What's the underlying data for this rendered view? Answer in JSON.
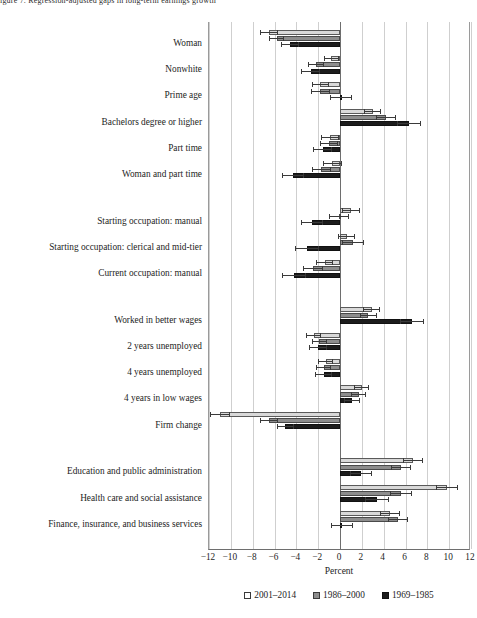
{
  "figure_note": "igure 7. Regression-adjusted gaps in long-term earnings growth",
  "chart_data": {
    "type": "bar",
    "orientation": "horizontal",
    "title": "",
    "xlabel": "Percent",
    "ylabel": "",
    "xlim": [
      -12,
      12
    ],
    "xticks": [
      "−12",
      "−10",
      "−8",
      "−6",
      "−4",
      "−2",
      "0",
      "2",
      "4",
      "6",
      "8",
      "10",
      "12"
    ],
    "xtick_values": [
      -12,
      -10,
      -8,
      -6,
      -4,
      -2,
      0,
      2,
      4,
      6,
      8,
      10,
      12
    ],
    "grid": true,
    "legend_position": "bottom",
    "legend": [
      "2001–2014",
      "1986–2000",
      "1969–1985"
    ],
    "series": [
      {
        "name": "2001–2014",
        "color": "#d9d9d9"
      },
      {
        "name": "1986–2000",
        "color": "#8d8d8d"
      },
      {
        "name": "1969–1985",
        "color": "#1c1c1c"
      }
    ],
    "groups": [
      {
        "rows": [
          {
            "category": "Woman",
            "values": [
              -6.5,
              -5.8,
              -4.6
            ],
            "err_low": [
              -7.3,
              -6.5,
              -5.4
            ],
            "err_high": [
              -5.7,
              -5.1,
              -3.8
            ]
          },
          {
            "category": "Nonwhite",
            "values": [
              -0.8,
              -2.2,
              -2.7
            ],
            "err_low": [
              -1.5,
              -2.9,
              -3.6
            ],
            "err_high": [
              -0.1,
              -1.5,
              -1.8
            ]
          },
          {
            "category": "Prime age",
            "values": [
              -1.8,
              -1.8,
              0.1
            ],
            "err_low": [
              -2.6,
              -2.7,
              -0.9
            ],
            "err_high": [
              -1.0,
              -0.9,
              1.1
            ]
          },
          {
            "category": "Bachelors degree or higher",
            "values": [
              3.0,
              4.2,
              6.3
            ],
            "err_low": [
              2.2,
              3.3,
              5.2
            ],
            "err_high": [
              3.8,
              5.1,
              7.4
            ]
          },
          {
            "category": "Part time",
            "values": [
              -0.9,
              -1.0,
              -1.6
            ],
            "err_low": [
              -1.7,
              -1.8,
              -2.5
            ],
            "err_high": [
              -0.1,
              -0.2,
              -0.7
            ]
          },
          {
            "category": "Woman and part time",
            "values": [
              -0.7,
              -1.7,
              -4.3
            ],
            "err_low": [
              -1.6,
              -2.6,
              -5.3
            ],
            "err_high": [
              0.2,
              -0.8,
              -3.3
            ]
          }
        ]
      },
      {
        "rows": [
          {
            "category": "Starting occupation: manual",
            "values": [
              1.0,
              -0.1,
              -2.6
            ],
            "err_low": [
              0.2,
              -1.0,
              -3.6
            ],
            "err_high": [
              1.8,
              0.8,
              -1.6
            ]
          },
          {
            "category": "Starting occupation: clerical and mid-tier",
            "values": [
              0.6,
              1.2,
              -3.0
            ],
            "err_low": [
              -0.2,
              0.2,
              -4.1
            ],
            "err_high": [
              1.4,
              2.2,
              -1.9
            ]
          },
          {
            "category": "Current occupation: manual",
            "values": [
              -1.4,
              -2.5,
              -4.2
            ],
            "err_low": [
              -2.2,
              -3.4,
              -5.3
            ],
            "err_high": [
              -0.6,
              -1.6,
              -3.1
            ]
          }
        ]
      },
      {
        "rows": [
          {
            "category": "Worked in better wages",
            "values": [
              2.9,
              2.6,
              6.6
            ],
            "err_low": [
              2.1,
              1.8,
              5.5
            ],
            "err_high": [
              3.7,
              3.4,
              7.7
            ]
          },
          {
            "category": "2 years unemployed",
            "values": [
              -2.4,
              -1.9,
              -2.0
            ],
            "err_low": [
              -3.1,
              -2.6,
              -2.8
            ],
            "err_high": [
              -1.7,
              -1.2,
              -1.2
            ]
          },
          {
            "category": "4 years unemployed",
            "values": [
              -1.3,
              -1.5,
              -1.5
            ],
            "err_low": [
              -2.0,
              -2.2,
              -2.3
            ],
            "err_high": [
              -0.6,
              -0.8,
              -0.7
            ]
          },
          {
            "category": "4 years in low wages",
            "values": [
              2.0,
              1.7,
              1.1
            ],
            "err_low": [
              1.3,
              1.0,
              0.4
            ],
            "err_high": [
              2.7,
              2.4,
              1.8
            ]
          },
          {
            "category": "Firm change",
            "values": [
              -11.0,
              -6.5,
              -5.0
            ],
            "err_low": [
              -11.9,
              -7.3,
              -5.8
            ],
            "err_high": [
              -10.1,
              -5.7,
              -4.2
            ]
          }
        ]
      },
      {
        "rows": [
          {
            "category": "Education and public administration",
            "values": [
              6.7,
              5.6,
              1.9
            ],
            "err_low": [
              5.8,
              4.7,
              0.9
            ],
            "err_high": [
              7.6,
              6.5,
              2.9
            ]
          },
          {
            "category": "Health care and social assistance",
            "values": [
              9.8,
              5.6,
              3.4
            ],
            "err_low": [
              8.8,
              4.6,
              2.3
            ],
            "err_high": [
              10.8,
              6.6,
              4.5
            ]
          },
          {
            "category": "Finance, insurance, and business services",
            "values": [
              4.6,
              5.3,
              0.2
            ],
            "err_low": [
              3.7,
              4.4,
              -0.8
            ],
            "err_high": [
              5.5,
              6.2,
              1.2
            ]
          }
        ]
      }
    ]
  }
}
